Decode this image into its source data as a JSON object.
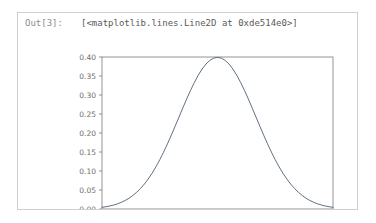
{
  "notebook": {
    "out_prompt": "Out[3]:",
    "out_repr": "[<matplotlib.lines.Line2D at 0xde514e0>]",
    "cell_border_color": "#cfcfcf",
    "prompt_color": "#8c8c8c",
    "repr_color": "#5a5a5a"
  },
  "chart_data": {
    "type": "line",
    "title": "",
    "xlabel": "",
    "ylabel": "",
    "xlim": [
      -3,
      3
    ],
    "ylim": [
      0.0,
      0.4
    ],
    "grid": false,
    "legend_position": "none",
    "line_color": "#4f5f73",
    "line_width": 0.9,
    "xticks": [
      -3,
      -2,
      -1,
      0,
      1,
      2,
      3
    ],
    "xticklabels": [
      "−3",
      "−2",
      "−1",
      "0",
      "1",
      "2",
      "3"
    ],
    "yticks": [
      0.0,
      0.05,
      0.1,
      0.15,
      0.2,
      0.25,
      0.3,
      0.35,
      0.4
    ],
    "yticklabels": [
      "0.00",
      "0.05",
      "0.10",
      "0.15",
      "0.20",
      "0.25",
      "0.30",
      "0.35",
      "0.40"
    ],
    "series": [
      {
        "name": "normal pdf",
        "x": [
          -3.0,
          -2.9,
          -2.8,
          -2.7,
          -2.6,
          -2.5,
          -2.4,
          -2.3,
          -2.2,
          -2.1,
          -2.0,
          -1.9,
          -1.8,
          -1.7,
          -1.6,
          -1.5,
          -1.4,
          -1.3,
          -1.2,
          -1.1,
          -1.0,
          -0.9,
          -0.8,
          -0.7,
          -0.6,
          -0.5,
          -0.4,
          -0.3,
          -0.2,
          -0.1,
          0.0,
          0.1,
          0.2,
          0.3,
          0.4,
          0.5,
          0.6,
          0.7,
          0.8,
          0.9,
          1.0,
          1.1,
          1.2,
          1.3,
          1.4,
          1.5,
          1.6,
          1.7,
          1.8,
          1.9,
          2.0,
          2.1,
          2.2,
          2.3,
          2.4,
          2.5,
          2.6,
          2.7,
          2.8,
          2.9,
          3.0
        ],
        "y": [
          0.0044,
          0.006,
          0.0079,
          0.0104,
          0.0136,
          0.0175,
          0.0224,
          0.0283,
          0.0355,
          0.044,
          0.054,
          0.0656,
          0.079,
          0.094,
          0.1109,
          0.1295,
          0.1497,
          0.1714,
          0.1942,
          0.2179,
          0.242,
          0.2661,
          0.2897,
          0.3123,
          0.3332,
          0.3521,
          0.3683,
          0.3814,
          0.391,
          0.397,
          0.3989,
          0.397,
          0.391,
          0.3814,
          0.3683,
          0.3521,
          0.3332,
          0.3123,
          0.2897,
          0.2661,
          0.242,
          0.2179,
          0.1942,
          0.1714,
          0.1497,
          0.1295,
          0.1109,
          0.094,
          0.079,
          0.0656,
          0.054,
          0.044,
          0.0355,
          0.0283,
          0.0224,
          0.0175,
          0.0136,
          0.0104,
          0.0079,
          0.006,
          0.0044
        ]
      }
    ]
  }
}
